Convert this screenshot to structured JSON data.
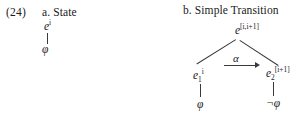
{
  "figure": {
    "example_number": "(24)",
    "background_color": "#ffffff",
    "ink_color": "#1a1a1a",
    "line_color": "#3a3a3a"
  },
  "part_a": {
    "heading": "a. State",
    "event_node": {
      "base": "e",
      "superscript": "i"
    },
    "formula_node": "φ"
  },
  "part_b": {
    "heading": "b. Simple Transition",
    "root_node": {
      "base": "e",
      "superscript": "[i,i+1]"
    },
    "left_child": {
      "base": "e",
      "subscript": "1",
      "superscript": "i"
    },
    "right_child": {
      "base": "e",
      "subscript": "2",
      "superscript": "[i+1]"
    },
    "transition_label": "α",
    "left_leaf": "φ",
    "right_leaf": "¬φ"
  }
}
